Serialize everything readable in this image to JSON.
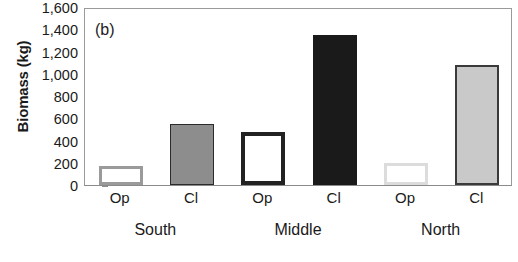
{
  "chart_data": {
    "type": "bar",
    "title": "",
    "panel_label": "(b)",
    "xlabel": "",
    "ylabel": "Biomass (kg)",
    "ylim": [
      0,
      1600
    ],
    "yticks": [
      0,
      200,
      400,
      600,
      800,
      1000,
      1200,
      1400,
      1600
    ],
    "ytick_labels": [
      "0",
      "200",
      "400",
      "600",
      "800",
      "1,000",
      "1,200",
      "1,400",
      "1,600"
    ],
    "grid": false,
    "legend": "none",
    "categories": [
      "Op",
      "Cl",
      "Op",
      "Cl",
      "Op",
      "Cl"
    ],
    "groups": [
      {
        "label": "South",
        "categories": [
          "Op",
          "Cl"
        ]
      },
      {
        "label": "Middle",
        "categories": [
          "Op",
          "Cl"
        ]
      },
      {
        "label": "North",
        "categories": [
          "Op",
          "Cl"
        ]
      }
    ],
    "values": [
      170,
      545,
      475,
      1345,
      195,
      1075
    ],
    "bars": [
      {
        "group": "South",
        "category": "Op",
        "value": 170,
        "fill": "#ffffff",
        "stroke": "#9a9a9a",
        "stroke_width": 3
      },
      {
        "group": "South",
        "category": "Cl",
        "value": 545,
        "fill": "#8d8d8d",
        "stroke": "#2b2b2b",
        "stroke_width": 1
      },
      {
        "group": "Middle",
        "category": "Op",
        "value": 475,
        "fill": "#ffffff",
        "stroke": "#222222",
        "stroke_width": 4
      },
      {
        "group": "Middle",
        "category": "Cl",
        "value": 1345,
        "fill": "#1a1a1a",
        "stroke": "#1a1a1a",
        "stroke_width": 1
      },
      {
        "group": "North",
        "category": "Op",
        "value": 195,
        "fill": "#ffffff",
        "stroke": "#dcdcdc",
        "stroke_width": 3
      },
      {
        "group": "North",
        "category": "Cl",
        "value": 1075,
        "fill": "#c9c9c9",
        "stroke": "#3a3a3a",
        "stroke_width": 2
      }
    ]
  },
  "axis": {
    "y_title": "Biomass (kg)",
    "tick_labels": [
      "1,600",
      "1,400",
      "1,200",
      "1,000",
      "800",
      "600",
      "400",
      "200",
      "0"
    ],
    "x_tick_labels": [
      "Op",
      "Cl",
      "Op",
      "Cl",
      "Op",
      "Cl"
    ],
    "group_labels": [
      "South",
      "Middle",
      "North"
    ]
  },
  "panel": {
    "letter": "(b)"
  }
}
